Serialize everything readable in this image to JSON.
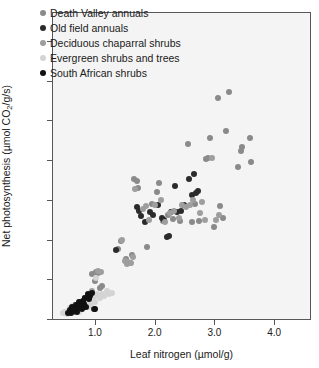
{
  "chart_data": {
    "type": "scatter",
    "title": "",
    "xlabel": "Leaf nitrogen (µmol/g)",
    "ylabel_prefix": "Net photosynthesis (µmol CO",
    "ylabel_sub": "2",
    "ylabel_suffix": "/g/s)",
    "xlim": [
      0.3,
      4.6
    ],
    "ylim": [
      0,
      770
    ],
    "xticks": [
      1.0,
      2.0,
      3.0,
      4.0
    ],
    "xtick_labels": [
      "1.0",
      "2.0",
      "3.0",
      "4.0"
    ],
    "yticks": [
      0,
      100,
      200,
      300,
      400,
      500,
      600,
      700
    ],
    "ytick_labels": [
      "0",
      "100",
      "200",
      "300",
      "400",
      "500",
      "600",
      "700"
    ],
    "grid": false,
    "legend_position": "top-left",
    "marker_size_px": 6,
    "background": "#f4f4f4",
    "frame_color": "#58585a",
    "series": [
      {
        "name": "Death Valley annuals",
        "color": "#8a8a8a",
        "points": [
          [
            0.6,
            28
          ],
          [
            0.66,
            34
          ],
          [
            0.7,
            22
          ],
          [
            0.74,
            40
          ],
          [
            0.78,
            30
          ],
          [
            0.82,
            48
          ],
          [
            0.86,
            38
          ],
          [
            0.9,
            58
          ],
          [
            0.93,
            66
          ],
          [
            0.96,
            112
          ],
          [
            1.0,
            96
          ],
          [
            1.02,
            118
          ],
          [
            1.05,
            116
          ],
          [
            1.08,
            78
          ],
          [
            1.12,
            84
          ],
          [
            1.38,
            176
          ],
          [
            1.44,
            196
          ],
          [
            1.52,
            150
          ],
          [
            1.58,
            142
          ],
          [
            1.62,
            160
          ],
          [
            1.66,
            352
          ],
          [
            1.7,
            348
          ],
          [
            1.72,
            330
          ],
          [
            1.88,
            180
          ],
          [
            1.96,
            290
          ],
          [
            2.04,
            320
          ],
          [
            2.08,
            342
          ],
          [
            2.14,
            246
          ],
          [
            2.22,
            262
          ],
          [
            2.3,
            252
          ],
          [
            2.42,
            246
          ],
          [
            2.48,
            286
          ],
          [
            2.56,
            440
          ],
          [
            2.62,
            244
          ],
          [
            2.68,
            290
          ],
          [
            2.74,
            246
          ],
          [
            2.86,
            402
          ],
          [
            2.9,
            404
          ],
          [
            2.92,
            456
          ],
          [
            3.0,
            232
          ],
          [
            3.06,
            556
          ],
          [
            3.1,
            284
          ],
          [
            3.14,
            254
          ],
          [
            3.2,
            474
          ],
          [
            3.24,
            572
          ],
          [
            3.4,
            382
          ],
          [
            3.44,
            424
          ],
          [
            3.46,
            432
          ],
          [
            3.6,
            456
          ],
          [
            3.62,
            394
          ]
        ]
      },
      {
        "name": "Old field annuals",
        "color": "#2b2b2b",
        "points": [
          [
            0.58,
            20
          ],
          [
            0.62,
            26
          ],
          [
            0.64,
            18
          ],
          [
            0.68,
            30
          ],
          [
            0.72,
            24
          ],
          [
            0.76,
            44
          ],
          [
            0.8,
            36
          ],
          [
            0.84,
            52
          ],
          [
            0.88,
            60
          ],
          [
            0.92,
            56
          ],
          [
            0.98,
            26
          ],
          [
            1.36,
            174
          ],
          [
            1.7,
            282
          ],
          [
            1.74,
            272
          ],
          [
            1.78,
            260
          ],
          [
            1.84,
            244
          ],
          [
            1.92,
            268
          ],
          [
            1.98,
            262
          ],
          [
            2.06,
            286
          ],
          [
            2.12,
            254
          ],
          [
            2.16,
            250
          ],
          [
            2.2,
            206
          ],
          [
            2.24,
            210
          ],
          [
            2.28,
            268
          ],
          [
            2.34,
            334
          ],
          [
            2.38,
            268
          ],
          [
            2.44,
            272
          ],
          [
            2.5,
            286
          ],
          [
            2.58,
            352
          ],
          [
            2.62,
            312
          ],
          [
            2.66,
            366
          ],
          [
            2.7,
            316
          ],
          [
            2.72,
            322
          ]
        ]
      },
      {
        "name": "Deciduous chaparral shrubs",
        "color": "#9e9e9e",
        "points": [
          [
            0.68,
            32
          ],
          [
            0.75,
            42
          ],
          [
            0.85,
            54
          ],
          [
            0.95,
            70
          ],
          [
            1.06,
            120
          ],
          [
            1.1,
            118
          ],
          [
            1.45,
            200
          ],
          [
            1.5,
            146
          ],
          [
            1.54,
            138
          ],
          [
            1.56,
            144
          ],
          [
            1.6,
            140
          ],
          [
            1.64,
            156
          ],
          [
            1.68,
            328
          ],
          [
            1.8,
            276
          ],
          [
            1.86,
            284
          ],
          [
            1.9,
            250
          ],
          [
            2.0,
            286
          ],
          [
            2.1,
            300
          ],
          [
            2.18,
            244
          ],
          [
            2.26,
            266
          ],
          [
            2.32,
            272
          ],
          [
            2.4,
            254
          ],
          [
            2.46,
            288
          ],
          [
            2.52,
            282
          ],
          [
            2.6,
            288
          ],
          [
            2.64,
            300
          ],
          [
            2.76,
            266
          ],
          [
            2.8,
            294
          ],
          [
            2.84,
            250
          ],
          [
            2.96,
            404
          ],
          [
            3.02,
            250
          ],
          [
            3.08,
            262
          ]
        ]
      },
      {
        "name": "Evergreen shrubs and trees",
        "color": "#d4d4d4",
        "points": [
          [
            0.46,
            14
          ],
          [
            0.5,
            18
          ],
          [
            0.54,
            12
          ],
          [
            0.56,
            22
          ],
          [
            0.58,
            28
          ],
          [
            0.6,
            16
          ],
          [
            0.62,
            24
          ],
          [
            0.64,
            32
          ],
          [
            0.66,
            20
          ],
          [
            0.7,
            26
          ],
          [
            0.72,
            34
          ],
          [
            0.74,
            18
          ],
          [
            0.78,
            40
          ],
          [
            0.8,
            28
          ],
          [
            0.82,
            36
          ],
          [
            0.86,
            44
          ],
          [
            0.88,
            30
          ],
          [
            0.9,
            50
          ],
          [
            0.94,
            38
          ],
          [
            0.98,
            56
          ],
          [
            1.0,
            44
          ],
          [
            1.02,
            102
          ],
          [
            1.04,
            62
          ],
          [
            1.08,
            54
          ],
          [
            1.12,
            64
          ],
          [
            1.16,
            58
          ],
          [
            1.2,
            70
          ],
          [
            1.24,
            62
          ],
          [
            1.28,
            66
          ]
        ]
      },
      {
        "name": "South African shrubs",
        "color": "#111111",
        "points": [
          [
            0.55,
            16
          ],
          [
            0.58,
            22
          ],
          [
            0.6,
            14
          ],
          [
            0.62,
            30
          ],
          [
            0.64,
            20
          ],
          [
            0.66,
            26
          ],
          [
            0.68,
            36
          ],
          [
            0.7,
            18
          ],
          [
            0.72,
            28
          ],
          [
            0.74,
            42
          ],
          [
            0.76,
            34
          ],
          [
            0.78,
            24
          ],
          [
            0.8,
            46
          ],
          [
            0.82,
            38
          ],
          [
            0.84,
            54
          ],
          [
            0.86,
            30
          ],
          [
            0.88,
            62
          ],
          [
            0.9,
            50
          ],
          [
            0.92,
            58
          ],
          [
            0.96,
            66
          ],
          [
            1.0,
            26
          ]
        ]
      }
    ]
  },
  "legend": {
    "items": [
      {
        "label": "Death Valley annuals",
        "color": "#8a8a8a"
      },
      {
        "label": "Old field annuals",
        "color": "#2b2b2b"
      },
      {
        "label": "Deciduous chaparral shrubs",
        "color": "#9e9e9e"
      },
      {
        "label": "Evergreen shrubs and trees",
        "color": "#d4d4d4"
      },
      {
        "label": "South African shrubs",
        "color": "#111111"
      }
    ]
  }
}
